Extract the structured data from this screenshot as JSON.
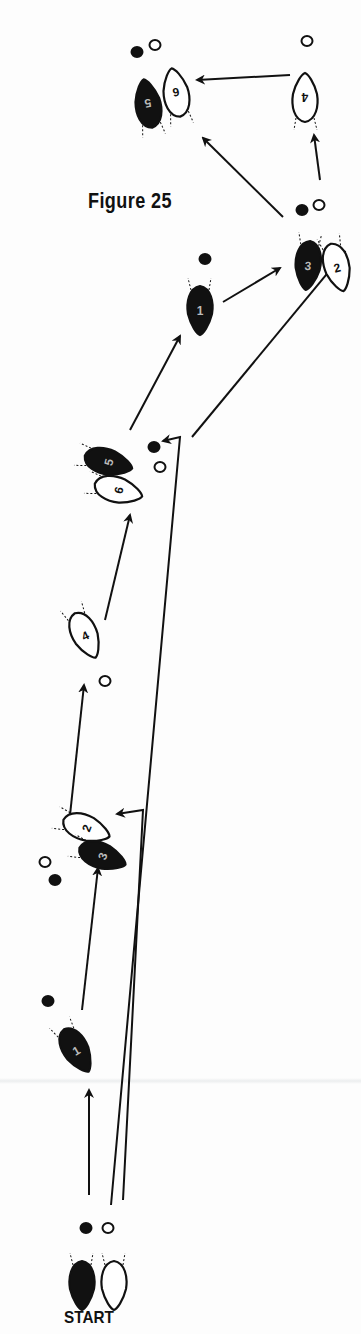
{
  "figure": {
    "title": "Figure 25",
    "start_label": "START"
  },
  "colors": {
    "ink": "#111111",
    "paper": "#fdfdfd"
  },
  "steps": [
    {
      "id": "start-left",
      "number": "",
      "fill": "dark",
      "x": 82,
      "y": 1285,
      "rot": 0,
      "heel": "dark"
    },
    {
      "id": "start-right",
      "number": "",
      "fill": "light",
      "x": 114,
      "y": 1285,
      "rot": 0,
      "heel": "light"
    },
    {
      "id": "step-1a",
      "number": "1",
      "fill": "dark",
      "x": 76,
      "y": 1050,
      "rot": -30,
      "heel": "dark"
    },
    {
      "id": "step-2a",
      "number": "2",
      "fill": "light",
      "x": 86,
      "y": 828,
      "rot": -70,
      "heel": "light"
    },
    {
      "id": "step-3a",
      "number": "3",
      "fill": "dark",
      "x": 102,
      "y": 856,
      "rot": -70,
      "heel": "dark"
    },
    {
      "id": "step-4a",
      "number": "4",
      "fill": "light",
      "x": 85,
      "y": 635,
      "rot": -25,
      "heel": "light"
    },
    {
      "id": "step-5a",
      "number": "5",
      "fill": "dark",
      "x": 108,
      "y": 462,
      "rot": -75,
      "heel": "dark"
    },
    {
      "id": "step-6a",
      "number": "6",
      "fill": "light",
      "x": 118,
      "y": 490,
      "rot": -75,
      "heel": "light"
    },
    {
      "id": "step-1b",
      "number": "1",
      "fill": "dark",
      "x": 200,
      "y": 310,
      "rot": 0,
      "heel": "dark"
    },
    {
      "id": "step-3b",
      "number": "3",
      "fill": "dark",
      "x": 308,
      "y": 265,
      "rot": 5,
      "heel": "dark"
    },
    {
      "id": "step-2b",
      "number": "2",
      "fill": "light",
      "x": 337,
      "y": 267,
      "rot": -15,
      "heel": "light"
    },
    {
      "id": "step-4b",
      "number": "4",
      "fill": "light",
      "x": 305,
      "y": 98,
      "rot": 180,
      "heel": "light"
    },
    {
      "id": "step-5b",
      "number": "5",
      "fill": "dark",
      "x": 148,
      "y": 104,
      "rot": 170,
      "heel": "dark"
    },
    {
      "id": "step-6b",
      "number": "6",
      "fill": "light",
      "x": 176,
      "y": 93,
      "rot": 170,
      "heel": "light"
    }
  ],
  "heels": [
    {
      "x": 86,
      "y": 1228,
      "fill": "dark"
    },
    {
      "x": 108,
      "y": 1228,
      "fill": "light"
    },
    {
      "x": 48,
      "y": 1001,
      "fill": "dark"
    },
    {
      "x": 45,
      "y": 862,
      "fill": "light"
    },
    {
      "x": 55,
      "y": 880,
      "fill": "dark"
    },
    {
      "x": 105,
      "y": 681,
      "fill": "light"
    },
    {
      "x": 154,
      "y": 447,
      "fill": "dark"
    },
    {
      "x": 160,
      "y": 467,
      "fill": "light"
    },
    {
      "x": 205,
      "y": 259,
      "fill": "dark"
    },
    {
      "x": 302,
      "y": 210,
      "fill": "dark"
    },
    {
      "x": 319,
      "y": 205,
      "fill": "light"
    },
    {
      "x": 307,
      "y": 41,
      "fill": "light"
    },
    {
      "x": 137,
      "y": 52,
      "fill": "dark"
    },
    {
      "x": 155,
      "y": 45,
      "fill": "light"
    }
  ],
  "arrows": [
    {
      "from": [
        89,
        1195
      ],
      "to": [
        89,
        1090
      ]
    },
    {
      "from": [
        82,
        1010
      ],
      "to": [
        98,
        868
      ]
    },
    {
      "from": [
        70,
        815
      ],
      "to": [
        84,
        685
      ]
    },
    {
      "from": [
        105,
        620
      ],
      "to": [
        130,
        515
      ]
    },
    {
      "from": [
        130,
        430
      ],
      "to": [
        180,
        336
      ]
    },
    {
      "from": [
        223,
        302
      ],
      "to": [
        280,
        268
      ]
    },
    {
      "from": [
        192,
        437
      ],
      "to": [
        345,
        252
      ]
    },
    {
      "from": [
        320,
        180
      ],
      "to": [
        314,
        135
      ]
    },
    {
      "from": [
        290,
        75
      ],
      "to": [
        197,
        80
      ]
    },
    {
      "from": [
        283,
        217
      ],
      "to": [
        203,
        138
      ]
    }
  ],
  "long_paths": [
    {
      "points": [
        [
          111,
          1205
        ],
        [
          180,
          437
        ],
        [
          163,
          441
        ]
      ]
    },
    {
      "points": [
        [
          123,
          1200
        ],
        [
          143,
          810
        ],
        [
          117,
          814
        ]
      ]
    }
  ]
}
